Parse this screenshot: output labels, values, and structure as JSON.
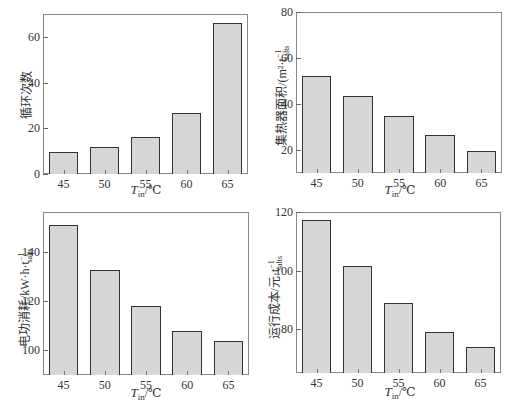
{
  "chart_data": [
    {
      "type": "bar",
      "title": "",
      "xlabel": "T_in/℃",
      "ylabel": "循环次数",
      "categories": [
        "45",
        "50",
        "55",
        "60",
        "65"
      ],
      "values": [
        9.5,
        12,
        16.3,
        26.5,
        66
      ],
      "ylim": [
        0,
        70
      ],
      "yticks": [
        "0",
        "20",
        "40",
        "60"
      ],
      "grid": false
    },
    {
      "type": "bar",
      "title": "",
      "xlabel": "T_in/℃",
      "ylabel": "集热器面积/(m²·t_salts⁻¹)",
      "categories": [
        "45",
        "50",
        "55",
        "60",
        "65"
      ],
      "values": [
        52,
        43.5,
        35,
        26.5,
        19.5
      ],
      "ylim": [
        10,
        80
      ],
      "yticks": [
        "20",
        "40",
        "60",
        "80"
      ],
      "grid": false
    },
    {
      "type": "bar",
      "title": "",
      "xlabel": "T_in/℃",
      "ylabel": "电功消耗/kW·h·t_salts⁻¹",
      "categories": [
        "45",
        "50",
        "55",
        "60",
        "65"
      ],
      "values": [
        150.6,
        132.7,
        118,
        107.8,
        103.7
      ],
      "ylim": [
        90,
        156
      ],
      "yticks": [
        "100",
        "120",
        "140"
      ],
      "grid": false
    },
    {
      "type": "bar",
      "title": "",
      "xlabel": "T_in/℃",
      "ylabel": "运行成本/元·t_salts⁻¹",
      "categories": [
        "45",
        "50",
        "55",
        "60",
        "65"
      ],
      "values": [
        117.2,
        101.7,
        89,
        79,
        74
      ],
      "ylim": [
        65,
        120
      ],
      "yticks": [
        "80",
        "100",
        "120"
      ],
      "grid": false
    }
  ],
  "labels": {
    "x_T": "T",
    "x_sub": "in",
    "x_unit": "/℃",
    "chart1_ylabel": "循环次数",
    "chart2_ylabel": "集热器面积/(m²·t",
    "chart2_ylabel_sub": "salts",
    "chart2_ylabel_sup": "−1",
    "chart2_ylabel_end": ")",
    "chart3_ylabel": "电功消耗/kW·h·t",
    "chart3_ylabel_sub": "salts",
    "chart3_ylabel_sup": "−1",
    "chart4_ylabel": "运行成本/元·t",
    "chart4_ylabel_sub": "salts",
    "chart4_ylabel_sup": "−1"
  },
  "colors": {
    "bar_fill": "#d6d6d6",
    "bar_edge": "#333333",
    "axis": "#888888"
  }
}
